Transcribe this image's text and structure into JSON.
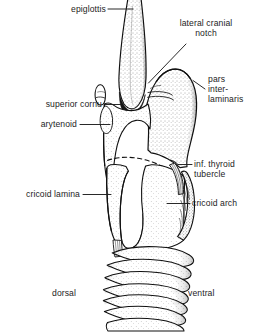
{
  "figure": {
    "type": "anatomical-line-drawing",
    "background_color": "#ffffff",
    "ink_color": "#111111",
    "label_color": "#1d1d1d",
    "stipple_color": "#4a4a4a"
  },
  "labels": {
    "epiglottis": "epiglottis",
    "lateral_cranial_notch_line1": "lateral cranial",
    "lateral_cranial_notch_line2": "notch",
    "pars_line1": "pars",
    "pars_line2": "inter-",
    "pars_line3": "laminaris",
    "superior_cornu": "superior cornu",
    "arytenoid": "arytenoid",
    "inf_thyroid_tubercle_line1": "inf. thyroid",
    "inf_thyroid_tubercle_line2": "tubercle",
    "cricoid_lamina": "cricoid lamina",
    "cricoid_arch": "cricoid arch",
    "dorsal": "dorsal",
    "ventral": "ventral"
  },
  "structures": [
    {
      "name": "epiglottis",
      "description": "tall tapering stippled blade at top center"
    },
    {
      "name": "lateral-cranial-notch",
      "description": "notch on cranial border of thyroid lamina"
    },
    {
      "name": "pars-interlaminaris",
      "description": "stippled thyroid cartilage lamina, right side"
    },
    {
      "name": "superior-cornu",
      "description": "small dorsal process of thyroid cartilage"
    },
    {
      "name": "arytenoid",
      "description": "cartilage dorsal to thyroid body"
    },
    {
      "name": "inf-thyroid-tubercle",
      "description": "striated band at caudoventral thyroid"
    },
    {
      "name": "cricoid-lamina",
      "description": "broad dorsal plate of cricoid"
    },
    {
      "name": "cricoid-arch",
      "description": "ventral narrow band of cricoid"
    },
    {
      "name": "tracheal-rings",
      "description": "seven stacked tracheal cartilage rings"
    }
  ],
  "orientation": {
    "left": "dorsal",
    "right": "ventral"
  }
}
